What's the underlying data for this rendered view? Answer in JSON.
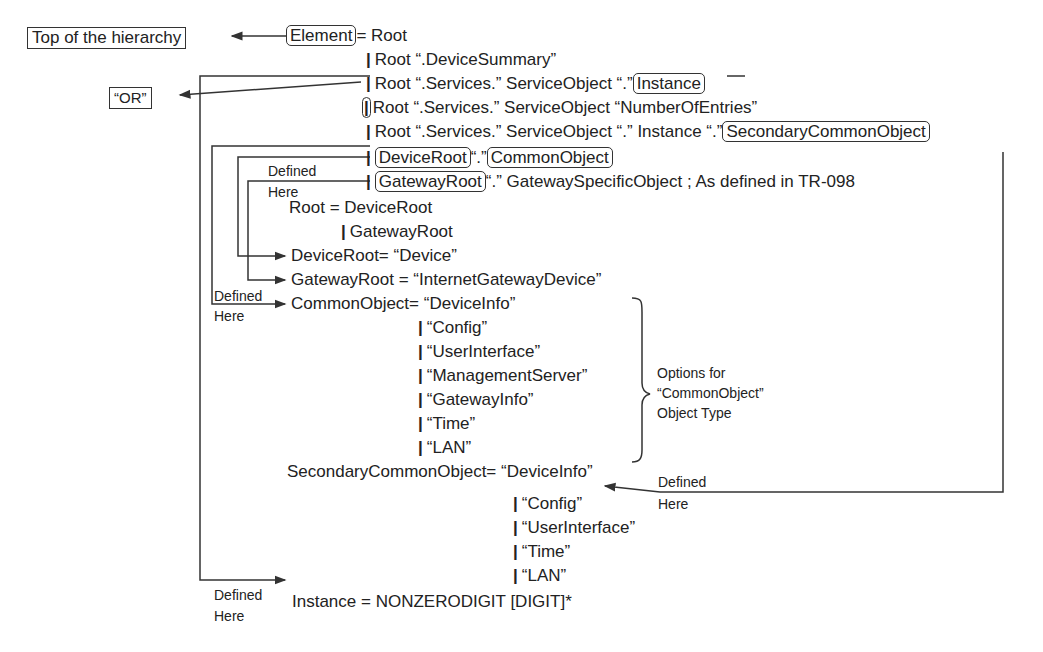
{
  "top_box": "Top of the hierarchy",
  "or_box": "“OR”",
  "element_line": {
    "element": "Element",
    "rest": "= Root"
  },
  "root_alternatives": [
    {
      "text": "Root “.DeviceSummary”"
    },
    {
      "text": "Root “.Services.” ServiceObject “.”",
      "boxed": "Instance"
    },
    {
      "text": "Root “.Services.” ServiceObject “NumberOfEntries”"
    },
    {
      "text": "Root “.Services.” ServiceObject “.” Instance “.”",
      "boxed": "SecondaryCommonObject"
    }
  ],
  "device_line": {
    "root": "DeviceRoot",
    "dot": "“.”",
    "obj": "CommonObject"
  },
  "gateway_line": {
    "root": "GatewayRoot",
    "rest": "“.” GatewaySpecificObject ; As defined in TR-098"
  },
  "root_def": {
    "line1": "Root = DeviceRoot",
    "line2": "GatewayRoot"
  },
  "deviceroot_def": "DeviceRoot= “Device”",
  "gatewayroot_def": "GatewayRoot = “InternetGatewayDevice”",
  "common_object": {
    "lhs": "CommonObject= “DeviceInfo”",
    "options": [
      "“Config”",
      "“UserInterface”",
      "“ManagementServer”",
      "“GatewayInfo”",
      "“Time”",
      "“LAN”"
    ],
    "note": [
      "Options for",
      "“CommonObject”",
      "Object Type"
    ]
  },
  "secondary_common_object": {
    "lhs": "SecondaryCommonObject= “DeviceInfo”",
    "options": [
      "“Config”",
      "“UserInterface”",
      "“Time”",
      "“LAN”"
    ]
  },
  "instance_def": "Instance = NONZERODIGIT [DIGIT]*",
  "defined_here": {
    "line1": "Defined",
    "line2": "Here"
  },
  "bar": "|"
}
